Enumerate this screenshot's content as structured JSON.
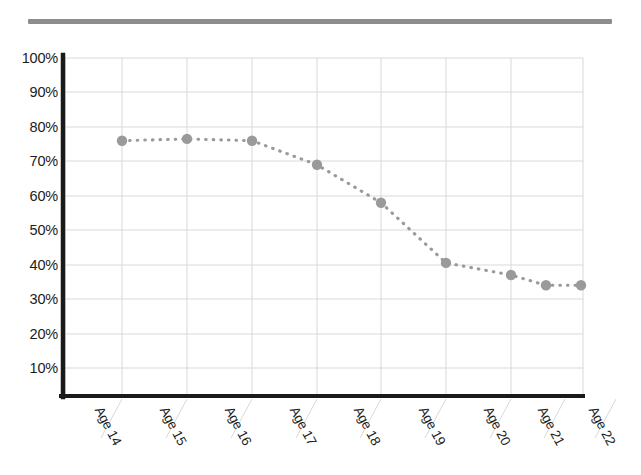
{
  "chart_data": {
    "type": "line",
    "title": "",
    "subtitle": "",
    "xlabel": "",
    "ylabel": "",
    "categories": [
      "Age 14",
      "Age 15",
      "Age 16",
      "Age 17",
      "Age 18",
      "Age 19",
      "Age 20",
      "Age 21",
      "Age 22"
    ],
    "values": [
      76,
      76.5,
      76,
      69,
      58,
      40.5,
      37,
      34,
      34
    ],
    "series": [
      {
        "name": "",
        "values": [
          76,
          76.5,
          76,
          69,
          58,
          40.5,
          37,
          34,
          34
        ]
      }
    ],
    "ylim": [
      0,
      100
    ],
    "ytick_values": [
      10,
      20,
      30,
      40,
      50,
      60,
      70,
      80,
      90,
      100
    ],
    "ytick_labels": [
      "10%",
      "20%",
      "30%",
      "40%",
      "50%",
      "60%",
      "70%",
      "80%",
      "90%",
      "100%"
    ],
    "xtick_labels": [
      "Age 14",
      "Age 15",
      "Age 16",
      "Age 17",
      "Age 18",
      "Age 19",
      "Age 20",
      "Age 21",
      "Age 22"
    ],
    "grid": true,
    "legend": "none",
    "line_style": "dotted",
    "marker": "circle",
    "annotations": []
  },
  "style": {
    "marker_color": "#9a9a9a",
    "line_color": "#9a9a9a",
    "grid_color": "#d9d9d9",
    "axis_color": "#1a1a1a",
    "rule_color": "#8d8d8d",
    "background": "#ffffff",
    "label_color": "#1c1c1c"
  },
  "header": {
    "rule_label": "top-divider"
  }
}
